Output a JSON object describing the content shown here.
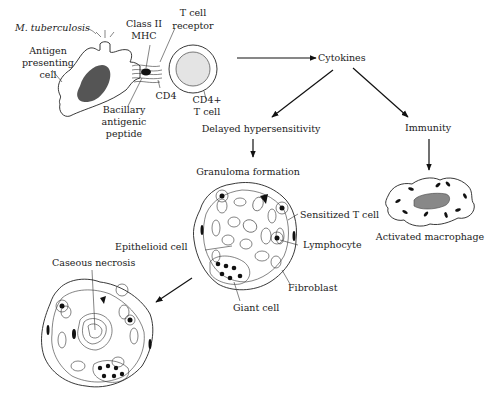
{
  "diagram": {
    "type": "biological-pathway",
    "nodes": {
      "pathogen": "M. tuberculosis",
      "apc": {
        "line1": "Antigen",
        "line2": "presenting",
        "line3": "cell"
      },
      "mhc": {
        "line1": "Class II",
        "line2": "MHC"
      },
      "tcr": {
        "line1": "T cell",
        "line2": "receptor"
      },
      "cd4": "CD4",
      "cd4_tcell": {
        "line1": "CD4+",
        "line2": "T cell"
      },
      "peptide": {
        "line1": "Bacillary",
        "line2": "antigenic",
        "line3": "peptide"
      },
      "cytokines": "Cytokines",
      "dth": "Delayed hypersensitivity",
      "immunity": "Immunity",
      "granuloma": "Granuloma formation",
      "macrophage": "Activated macrophage",
      "sensitized_t": "Sensitized T cell",
      "lymphocyte": "Lymphocyte",
      "epithelioid": "Epithelioid cell",
      "fibroblast": "Fibroblast",
      "giant_cell": "Giant cell",
      "caseous": "Caseous necrosis"
    },
    "edges": [
      {
        "from": "CD4+ T cell",
        "to": "Cytokines"
      },
      {
        "from": "Cytokines",
        "to": "Delayed hypersensitivity"
      },
      {
        "from": "Cytokines",
        "to": "Immunity"
      },
      {
        "from": "Delayed hypersensitivity",
        "to": "Granuloma formation"
      },
      {
        "from": "Immunity",
        "to": "Activated macrophage"
      },
      {
        "from": "Granuloma formation",
        "to": "Caseous necrosis"
      }
    ]
  }
}
